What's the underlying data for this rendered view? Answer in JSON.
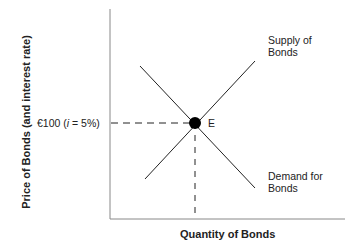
{
  "diagram": {
    "y_axis_label": "Price of Bonds (and interest rate)",
    "x_axis_label": "Quantity of Bonds",
    "price_label_prefix": "€100 (",
    "price_label_i": "i",
    "price_label_suffix": " = 5%)",
    "equilibrium_label": "E",
    "supply_label_line1": "Supply of",
    "supply_label_line2": "Bonds",
    "demand_label_line1": "Demand for",
    "demand_label_line2": "Bonds",
    "colors": {
      "line": "#222222",
      "axis": "#888888"
    }
  }
}
